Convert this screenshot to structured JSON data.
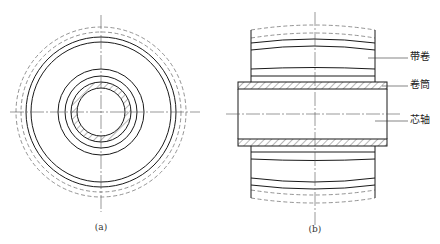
{
  "figure_a": {
    "caption": "(a)",
    "view": "end view of coil on mandrel",
    "center": [
      101,
      112
    ]
  },
  "figure_b": {
    "caption": "(b)",
    "view": "side section of coil on mandrel",
    "labels": {
      "coil": "带卷",
      "sleeve": "卷筒",
      "mandrel": "芯轴"
    }
  },
  "colors": {
    "line": "#1a1a1a",
    "dashed": "#777777",
    "centerline": "#555555",
    "background": "#ffffff"
  }
}
